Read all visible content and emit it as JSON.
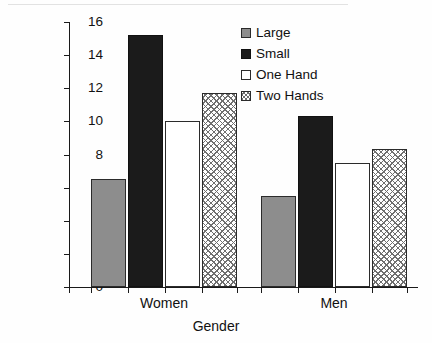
{
  "chart_data": {
    "type": "bar",
    "title": "",
    "xlabel": "Gender",
    "ylabel": "Mean Number of Gestures",
    "categories": [
      "Women",
      "Men"
    ],
    "series": [
      {
        "name": "Large",
        "values": [
          6.5,
          5.5
        ],
        "color": "#8d8d8d",
        "fill": "solid-gray"
      },
      {
        "name": "Small",
        "values": [
          15.2,
          10.3
        ],
        "color": "#1b1b1b",
        "fill": "solid-black"
      },
      {
        "name": "One Hand",
        "values": [
          10.0,
          7.5
        ],
        "color": "#ffffff",
        "fill": "open-white"
      },
      {
        "name": "Two Hands",
        "values": [
          11.7,
          8.35
        ],
        "color": "#6f6f6f",
        "fill": "crosshatch"
      }
    ],
    "ylim": [
      0,
      16
    ],
    "ytick_labels": [
      "0",
      "2",
      "4",
      "6",
      "8",
      "10",
      "12",
      "14",
      "16"
    ],
    "ytick_values": [
      0,
      2,
      4,
      6,
      8,
      10,
      12,
      14,
      16
    ],
    "ytick_step": 2,
    "grid": false,
    "legend_position": "top-right",
    "legend_entries": [
      "Large",
      "Small",
      "One Hand",
      "Two Hands"
    ]
  }
}
